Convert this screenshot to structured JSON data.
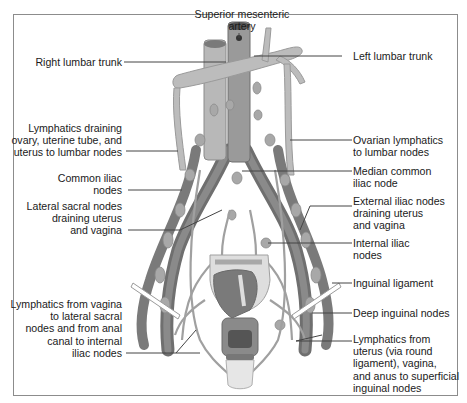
{
  "figure": {
    "colors": {
      "background": "#ffffff",
      "frame": "#8c8c8c",
      "vessel_dark": "#6f6f6f",
      "vessel_mid": "#9a9a9a",
      "lymphatic": "#b3b3b3",
      "lymphatic_light": "#c9c9c9",
      "organ_light": "#dedede",
      "leader_line": "#444444"
    }
  },
  "labels": {
    "top": {
      "superior_mesenteric_artery": [
        "Superior mesenteric",
        "artery"
      ]
    },
    "left": {
      "right_lumbar_trunk": [
        "Right lumbar trunk"
      ],
      "lymphatics_draining_ovary": [
        "Lymphatics draining",
        "ovary, uterine tube, and",
        "uterus to lumbar nodes"
      ],
      "common_iliac_nodes": [
        "Common iliac",
        "nodes"
      ],
      "lateral_sacral_nodes": [
        "Lateral sacral nodes",
        "draining uterus",
        "and vagina"
      ],
      "lymphatics_from_vagina": [
        "Lymphatics from vagina",
        "to lateral sacral",
        "nodes and from anal",
        "canal to internal",
        "iliac nodes"
      ]
    },
    "right": {
      "left_lumbar_trunk": [
        "Left lumbar trunk"
      ],
      "ovarian_lymphatics": [
        "Ovarian lymphatics",
        "to lumbar nodes"
      ],
      "median_common_iliac_node": [
        "Median common",
        "iliac node"
      ],
      "external_iliac_nodes": [
        "External iliac nodes",
        "draining uterus",
        "and vagina"
      ],
      "internal_iliac_nodes": [
        "Internal iliac",
        "nodes"
      ],
      "inguinal_ligament": [
        "Inguinal ligament"
      ],
      "deep_inguinal_nodes": [
        "Deep inguinal nodes"
      ],
      "lymphatics_from_uterus": [
        "Lymphatics from",
        "uterus (via round",
        "ligament), vagina,",
        "and anus to superficial",
        "inguinal nodes"
      ]
    }
  }
}
